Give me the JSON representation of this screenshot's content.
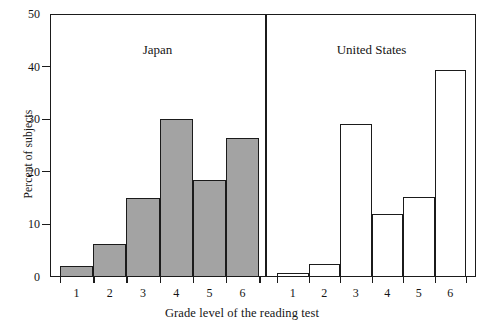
{
  "chart_data": {
    "type": "bar",
    "title": "",
    "xlabel": "Grade level of the reading test",
    "ylabel": "Percent of subjects",
    "categories": [
      "1",
      "2",
      "3",
      "4",
      "5",
      "6"
    ],
    "ylim": [
      0,
      50
    ],
    "yticks": [
      0,
      10,
      20,
      30,
      40,
      50
    ],
    "ytick_labels": [
      "0",
      "10",
      "20",
      "30",
      "40",
      "50"
    ],
    "grid": false,
    "legend": "none",
    "panels": [
      {
        "name": "Japan",
        "label": "Japan",
        "fill": "#a3a3a3",
        "style": "filled",
        "values": [
          2.0,
          6.3,
          15.0,
          30.0,
          18.5,
          26.5
        ]
      },
      {
        "name": "United States",
        "label": "United States",
        "fill": "#ffffff",
        "style": "hollow",
        "values": [
          0.8,
          2.5,
          29.0,
          12.0,
          15.3,
          39.3
        ]
      }
    ],
    "series": [
      {
        "name": "Japan",
        "values": [
          2.0,
          6.3,
          15.0,
          30.0,
          18.5,
          26.5
        ]
      },
      {
        "name": "United States",
        "values": [
          0.8,
          2.5,
          29.0,
          12.0,
          15.3,
          39.3
        ]
      }
    ]
  },
  "colors": {
    "axis": "#1b1b1b",
    "bar_fill_japan": "#a3a3a3",
    "bar_fill_us": "#ffffff",
    "background": "#ffffff"
  }
}
